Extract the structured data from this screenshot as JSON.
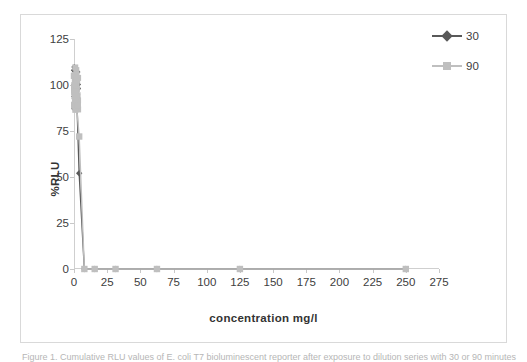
{
  "figure": {
    "caption": "Figure 1. Cumulative RLU values of E. coli T7 bioluminescent reporter after exposure to dilution series with 30 or 90 minutes"
  },
  "legend": {
    "position": "top-right",
    "entries": [
      {
        "label": "30",
        "color": "#595959",
        "marker": "diamond"
      },
      {
        "label": "90",
        "color": "#bfbfbf",
        "marker": "square"
      }
    ]
  },
  "chart_data": {
    "type": "line",
    "title": "",
    "xlabel": "concentration mg/l",
    "ylabel": "%RLU",
    "xlim": [
      0,
      275
    ],
    "ylim": [
      0,
      125
    ],
    "xticks": [
      0,
      25,
      50,
      75,
      100,
      125,
      150,
      175,
      200,
      225,
      250,
      275
    ],
    "yticks": [
      0,
      25,
      50,
      75,
      100,
      125
    ],
    "grid": false,
    "x": [
      0,
      0.5,
      1,
      2,
      3.9,
      7.8,
      15.6,
      31.3,
      62.5,
      125,
      250
    ],
    "series": [
      {
        "name": "30",
        "color": "#595959",
        "marker": "diamond",
        "values": [
          108,
          104,
          99,
          95,
          52,
          0,
          0,
          0,
          0,
          0,
          0
        ]
      },
      {
        "name": "90",
        "color": "#bfbfbf",
        "marker": "square",
        "values": [
          105,
          97,
          92,
          88,
          72,
          0,
          0,
          0,
          0,
          0,
          0
        ]
      }
    ],
    "cluster_note": "dense overlapping marker cluster near x=0 spanning roughly 85-110 %RLU"
  }
}
